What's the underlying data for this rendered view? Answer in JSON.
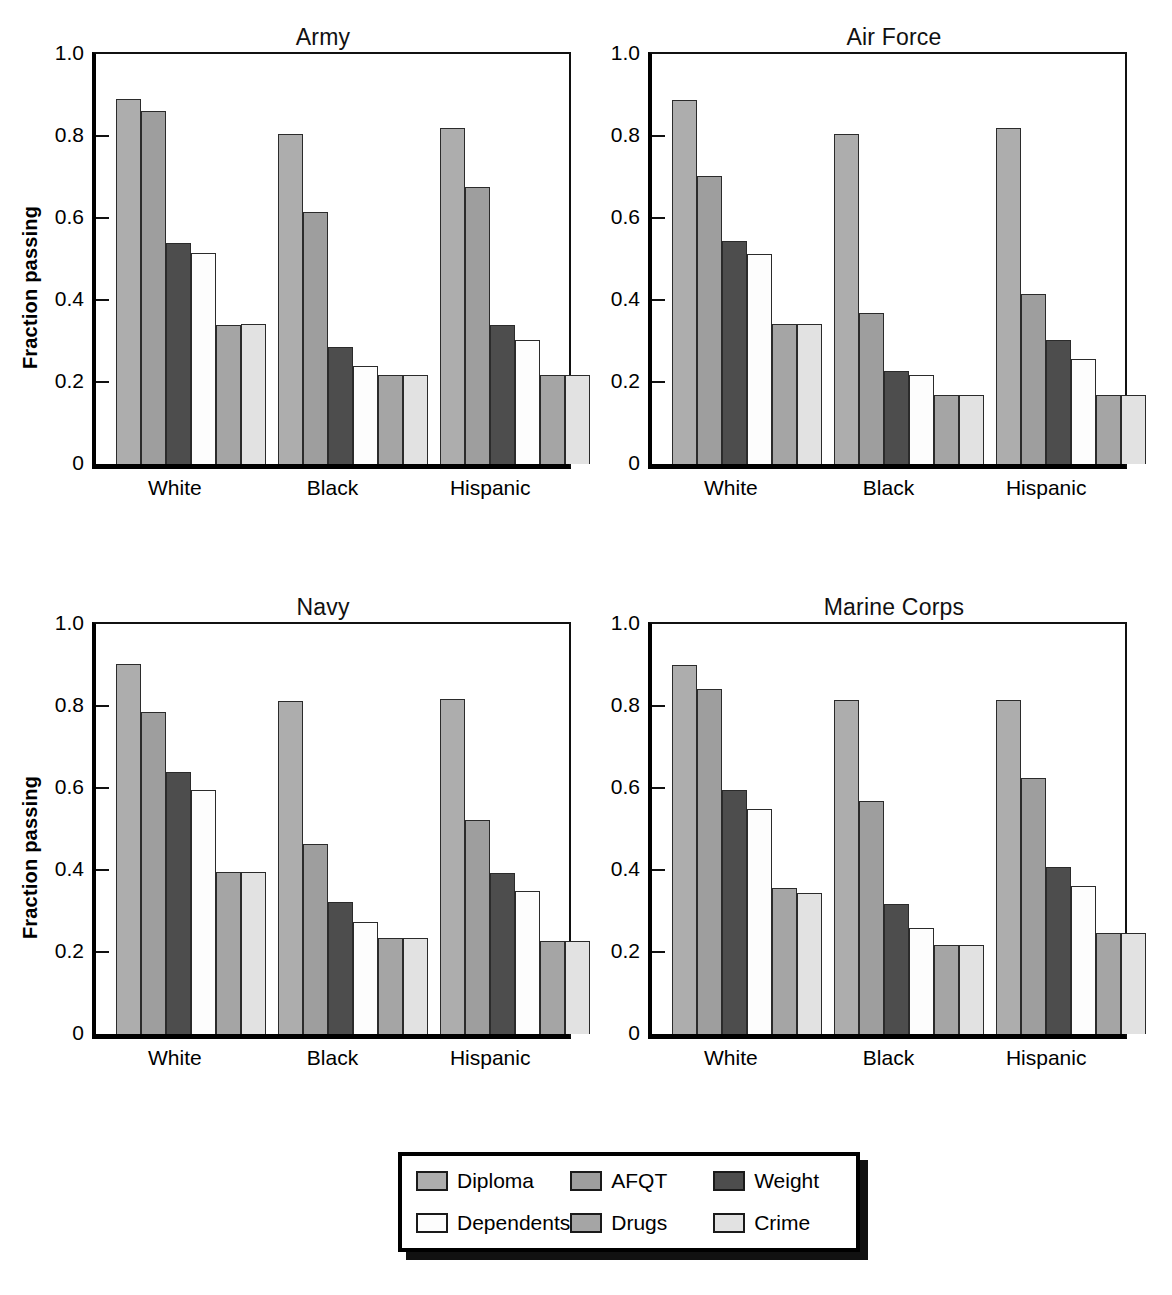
{
  "figure": {
    "ylabel": "Fraction passing"
  },
  "axis": {
    "yticks": [
      "1.0",
      "0.8",
      "0.6",
      "0.4",
      "0.2",
      "0"
    ],
    "ytick_values": [
      1.0,
      0.8,
      0.6,
      0.4,
      0.2,
      0
    ],
    "ylim": [
      0,
      1.0
    ],
    "categories": [
      "White",
      "Black",
      "Hispanic"
    ]
  },
  "legend": {
    "items": [
      {
        "label": "Diploma",
        "color": "#adadad"
      },
      {
        "label": "AFQT",
        "color": "#9e9e9e"
      },
      {
        "label": "Weight",
        "color": "#4d4d4d"
      },
      {
        "label": "Dependents",
        "color": "#fdfdfd"
      },
      {
        "label": "Drugs",
        "color": "#a5a5a5"
      },
      {
        "label": "Crime",
        "color": "#e2e2e2"
      }
    ]
  },
  "panels": [
    {
      "title": "Army",
      "row": 0,
      "col": 0
    },
    {
      "title": "Air Force",
      "row": 0,
      "col": 1
    },
    {
      "title": "Navy",
      "row": 1,
      "col": 0
    },
    {
      "title": "Marine Corps",
      "row": 1,
      "col": 1
    }
  ],
  "chart_data": {
    "type": "bar",
    "xlabel": "",
    "ylabel": "Fraction passing",
    "ylim": [
      0,
      1.0
    ],
    "yticks": [
      0,
      0.2,
      0.4,
      0.6,
      0.8,
      1.0
    ],
    "grid": false,
    "legend_position": "bottom-center",
    "categories": [
      "White",
      "Black",
      "Hispanic"
    ],
    "series_names": [
      "Diploma",
      "AFQT",
      "Weight",
      "Dependents",
      "Drugs",
      "Crime"
    ],
    "series_colors": [
      "#adadad",
      "#9e9e9e",
      "#4d4d4d",
      "#fdfdfd",
      "#a5a5a5",
      "#e2e2e2"
    ],
    "panels": [
      {
        "title": "Army",
        "series": [
          {
            "name": "Diploma",
            "values": [
              0.89,
              0.805,
              0.82
            ]
          },
          {
            "name": "AFQT",
            "values": [
              0.86,
              0.615,
              0.675
            ]
          },
          {
            "name": "Weight",
            "values": [
              0.54,
              0.285,
              0.34
            ]
          },
          {
            "name": "Dependents",
            "values": [
              0.515,
              0.24,
              0.303
            ]
          },
          {
            "name": "Drugs",
            "values": [
              0.34,
              0.217,
              0.216
            ]
          },
          {
            "name": "Crime",
            "values": [
              0.341,
              0.217,
              0.216
            ]
          }
        ]
      },
      {
        "title": "Air Force",
        "series": [
          {
            "name": "Diploma",
            "values": [
              0.888,
              0.805,
              0.82
            ]
          },
          {
            "name": "AFQT",
            "values": [
              0.703,
              0.368,
              0.415
            ]
          },
          {
            "name": "Weight",
            "values": [
              0.545,
              0.227,
              0.303
            ]
          },
          {
            "name": "Dependents",
            "values": [
              0.513,
              0.216,
              0.256
            ]
          },
          {
            "name": "Drugs",
            "values": [
              0.341,
              0.168,
              0.168
            ]
          },
          {
            "name": "Crime",
            "values": [
              0.341,
              0.168,
              0.169
            ]
          }
        ]
      },
      {
        "title": "Navy",
        "series": [
          {
            "name": "Diploma",
            "values": [
              0.902,
              0.813,
              0.818
            ]
          },
          {
            "name": "AFQT",
            "values": [
              0.785,
              0.463,
              0.523
            ]
          },
          {
            "name": "Weight",
            "values": [
              0.64,
              0.322,
              0.392
            ]
          },
          {
            "name": "Dependents",
            "values": [
              0.595,
              0.274,
              0.348
            ]
          },
          {
            "name": "Drugs",
            "values": [
              0.394,
              0.233,
              0.228
            ]
          },
          {
            "name": "Crime",
            "values": [
              0.394,
              0.233,
              0.228
            ]
          }
        ]
      },
      {
        "title": "Marine Corps",
        "series": [
          {
            "name": "Diploma",
            "values": [
              0.9,
              0.814,
              0.815
            ]
          },
          {
            "name": "AFQT",
            "values": [
              0.841,
              0.568,
              0.625
            ]
          },
          {
            "name": "Weight",
            "values": [
              0.594,
              0.317,
              0.408
            ]
          },
          {
            "name": "Dependents",
            "values": [
              0.55,
              0.259,
              0.36
            ]
          },
          {
            "name": "Drugs",
            "values": [
              0.357,
              0.216,
              0.246
            ]
          },
          {
            "name": "Crime",
            "values": [
              0.344,
              0.217,
              0.246
            ]
          }
        ]
      }
    ]
  }
}
